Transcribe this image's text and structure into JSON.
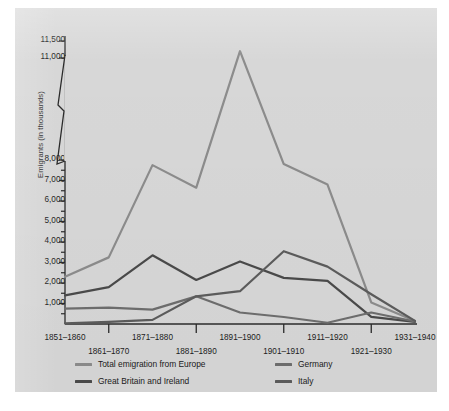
{
  "figure": {
    "background_color": "#d7d7d7",
    "axis_color": "#2b2b2b"
  },
  "chart_data": {
    "type": "line",
    "title": "",
    "xlabel": "",
    "ylabel": "Emigrants (in thousands)",
    "grid": false,
    "legend_position": "bottom",
    "axis_break": {
      "between": [
        11000,
        8000
      ],
      "note": "y-axis broken between 11,000 and 8,000"
    },
    "ylim": [
      0,
      11500
    ],
    "ytick_labels": [
      "11,500",
      "11,000",
      "8,000",
      "7,000",
      "6,000",
      "5,000",
      "4,000",
      "3,000",
      "2,000",
      "1,000"
    ],
    "ytick_values": [
      11500,
      11000,
      8000,
      7000,
      6000,
      5000,
      4000,
      3000,
      2000,
      1000
    ],
    "categories": [
      "1851–1860",
      "1861–1870",
      "1871–1880",
      "1881–1890",
      "1891–1900",
      "1901–1910",
      "1911–1920",
      "1921–1930",
      "1931–1940"
    ],
    "series": [
      {
        "name": "Total emigration from Europe",
        "color": "#8c8c8c",
        "values": [
          2300,
          3250,
          7750,
          6650,
          11200,
          7800,
          6800,
          1050,
          150
        ]
      },
      {
        "name": "Great Britain and Ireland",
        "color": "#4a4a4a",
        "values": [
          1400,
          1800,
          3350,
          2150,
          3050,
          2250,
          2100,
          350,
          100
        ]
      },
      {
        "name": "Germany",
        "color": "#6e6e6e",
        "values": [
          750,
          800,
          700,
          1350,
          560,
          340,
          60,
          560,
          120
        ]
      },
      {
        "name": "Italy",
        "color": "#5c5c5c",
        "values": [
          30,
          100,
          200,
          1350,
          1600,
          3550,
          2800,
          1450,
          150
        ]
      }
    ]
  },
  "xaxis": {
    "top_row": [
      "1851–1860",
      "1871–1880",
      "1891–1900",
      "1911–1920",
      "1931–1940"
    ],
    "bottom_row": [
      "1861–1870",
      "1881–1890",
      "1901–1910",
      "1921–1930"
    ]
  },
  "legend": {
    "entries": [
      {
        "label": "Total emigration from Europe",
        "color": "#8c8c8c"
      },
      {
        "label": "Germany",
        "color": "#6e6e6e"
      },
      {
        "label": "Great Britain and Ireland",
        "color": "#4a4a4a"
      },
      {
        "label": "Italy",
        "color": "#5c5c5c"
      }
    ]
  }
}
